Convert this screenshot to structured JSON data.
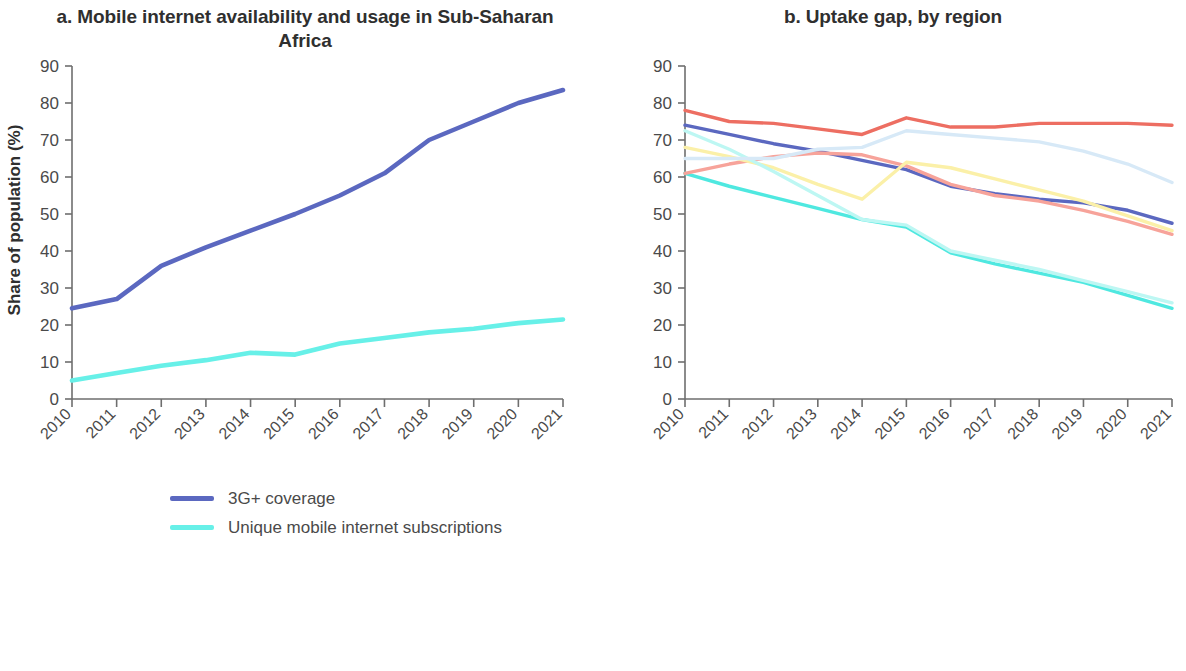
{
  "figure": {
    "background": "#ffffff"
  },
  "panel_a": {
    "title": "a. Mobile internet availability and usage in Sub-Saharan Africa",
    "ylabel": "Share of population (%)",
    "legend": [
      {
        "label": "3G+ coverage",
        "color": "#5b68c0"
      },
      {
        "label": "Unique mobile internet subscriptions",
        "color": "#67f0e8"
      }
    ]
  },
  "panel_b": {
    "title": "b. Uptake gap, by region",
    "ylabel": "Share of internet nonusers among\nthose with 3G+ coverage (%)",
    "legend": [
      {
        "label": "East Asia and Pacific",
        "color": "#5b68c0"
      },
      {
        "label": "Europe and Central Asia",
        "color": "#4fe8e0"
      },
      {
        "label": "Latin America and the Caribbean",
        "color": "#f7a39a"
      },
      {
        "label": "Middle East and North Africa",
        "color": "#fbf0a8"
      },
      {
        "label": "North America",
        "color": "#bdf7f3"
      },
      {
        "label": "South Asia",
        "color": "#d7e9f7"
      },
      {
        "label": "Sub-Saharan Africa",
        "color": "#ed6e62"
      }
    ]
  },
  "chart_data": [
    {
      "type": "line",
      "id": "panel-a",
      "title": "a. Mobile internet availability and usage in Sub-Saharan Africa",
      "xlabel": "",
      "ylabel": "Share of population (%)",
      "x": [
        "2010",
        "2011",
        "2012",
        "2013",
        "2014",
        "2015",
        "2016",
        "2017",
        "2018",
        "2019",
        "2020",
        "2021"
      ],
      "xlim": [
        2010,
        2021
      ],
      "ylim": [
        0,
        90
      ],
      "yticks": [
        0,
        10,
        20,
        30,
        40,
        50,
        60,
        70,
        80,
        90
      ],
      "grid": false,
      "legend_position": "below",
      "series": [
        {
          "name": "3G+ coverage",
          "color": "#5b68c0",
          "values": [
            24.5,
            27.0,
            36.0,
            41.0,
            45.5,
            50.0,
            55.0,
            61.0,
            70.0,
            75.0,
            80.0,
            83.5
          ]
        },
        {
          "name": "Unique mobile internet subscriptions",
          "color": "#67f0e8",
          "values": [
            5.0,
            7.0,
            9.0,
            10.5,
            12.5,
            12.0,
            15.0,
            16.5,
            18.0,
            19.0,
            20.5,
            21.5
          ]
        }
      ]
    },
    {
      "type": "line",
      "id": "panel-b",
      "title": "b. Uptake gap, by region",
      "xlabel": "",
      "ylabel": "Share of internet nonusers among those with 3G+ coverage (%)",
      "x": [
        "2010",
        "2011",
        "2012",
        "2013",
        "2014",
        "2015",
        "2016",
        "2017",
        "2018",
        "2019",
        "2020",
        "2021"
      ],
      "xlim": [
        2010,
        2021
      ],
      "ylim": [
        0,
        90
      ],
      "yticks": [
        0,
        10,
        20,
        30,
        40,
        50,
        60,
        70,
        80,
        90
      ],
      "grid": false,
      "legend_position": "below",
      "series": [
        {
          "name": "East Asia and Pacific",
          "color": "#5b68c0",
          "values": [
            74.0,
            71.5,
            69.0,
            67.0,
            64.5,
            62.0,
            57.5,
            55.5,
            54.0,
            53.0,
            51.0,
            47.5
          ]
        },
        {
          "name": "Europe and Central Asia",
          "color": "#4fe8e0",
          "values": [
            61.0,
            57.5,
            54.5,
            51.5,
            48.5,
            46.5,
            39.5,
            36.5,
            34.0,
            31.5,
            28.0,
            24.5
          ]
        },
        {
          "name": "Latin America and the Caribbean",
          "color": "#f7a39a",
          "values": [
            61.0,
            63.5,
            65.5,
            66.5,
            66.0,
            63.0,
            58.0,
            55.0,
            53.5,
            51.0,
            48.0,
            44.5
          ]
        },
        {
          "name": "Middle East and North Africa",
          "color": "#fbf0a8",
          "values": [
            68.0,
            65.5,
            62.5,
            58.0,
            54.0,
            64.0,
            62.5,
            59.5,
            56.5,
            53.5,
            49.5,
            45.5
          ]
        },
        {
          "name": "North America",
          "color": "#bdf7f3",
          "values": [
            72.5,
            67.5,
            61.5,
            55.0,
            48.5,
            47.0,
            40.0,
            37.5,
            35.0,
            32.0,
            29.0,
            26.0
          ]
        },
        {
          "name": "South Asia",
          "color": "#d7e9f7",
          "values": [
            65.0,
            65.0,
            65.0,
            67.5,
            68.0,
            72.5,
            71.5,
            70.5,
            69.5,
            67.0,
            63.5,
            58.5
          ]
        },
        {
          "name": "Sub-Saharan Africa",
          "color": "#ed6e62",
          "values": [
            78.0,
            75.0,
            74.5,
            73.0,
            71.5,
            76.0,
            73.5,
            73.5,
            74.5,
            74.5,
            74.5,
            74.0
          ]
        }
      ]
    }
  ]
}
